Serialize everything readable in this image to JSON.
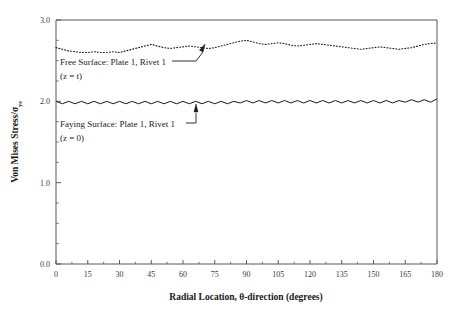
{
  "chart_data": {
    "type": "line",
    "title": "",
    "xlabel": "Radial Location, θ-direction (degrees)",
    "ylabel": "Von Mises Stress/σ",
    "ylabel_subscript": "ys",
    "xlim": [
      0,
      180
    ],
    "ylim": [
      0.0,
      3.0
    ],
    "grid": false,
    "legend_position": "inline-annotations",
    "xticks": [
      0,
      15,
      30,
      45,
      60,
      75,
      90,
      105,
      120,
      135,
      150,
      165,
      180
    ],
    "xticklabels": [
      "0",
      "15",
      "30",
      "45",
      "60",
      "75",
      "90",
      "105",
      "120",
      "135",
      "150",
      "165",
      "180"
    ],
    "yticks": [
      0.0,
      1.0,
      2.0,
      3.0
    ],
    "yticklabels": [
      "0.0",
      "1.0",
      "2.0",
      "3.0"
    ],
    "yticks_minor": [
      0.25,
      0.5,
      0.75,
      1.25,
      1.5,
      1.75,
      2.25,
      2.5,
      2.75
    ],
    "series": [
      {
        "name": "Free Surface: Plate 1, Rivet 1 (z = t)",
        "style": "dotted",
        "color": "#1a1a1a",
        "x": [
          0,
          3,
          6,
          9,
          12,
          15,
          18,
          21,
          24,
          27,
          30,
          33,
          36,
          39,
          42,
          45,
          48,
          51,
          54,
          57,
          60,
          63,
          66,
          69,
          72,
          75,
          78,
          81,
          84,
          87,
          90,
          93,
          96,
          99,
          102,
          105,
          108,
          111,
          114,
          117,
          120,
          123,
          126,
          129,
          132,
          135,
          138,
          141,
          144,
          147,
          150,
          153,
          156,
          159,
          162,
          165,
          168,
          171,
          174,
          177,
          180
        ],
        "y": [
          2.66,
          2.64,
          2.62,
          2.61,
          2.6,
          2.6,
          2.61,
          2.6,
          2.6,
          2.61,
          2.6,
          2.62,
          2.64,
          2.66,
          2.68,
          2.7,
          2.68,
          2.66,
          2.65,
          2.66,
          2.67,
          2.68,
          2.67,
          2.66,
          2.65,
          2.66,
          2.68,
          2.7,
          2.72,
          2.74,
          2.75,
          2.73,
          2.71,
          2.7,
          2.71,
          2.72,
          2.71,
          2.69,
          2.68,
          2.69,
          2.7,
          2.71,
          2.7,
          2.69,
          2.68,
          2.67,
          2.66,
          2.65,
          2.64,
          2.65,
          2.66,
          2.67,
          2.66,
          2.65,
          2.64,
          2.65,
          2.66,
          2.68,
          2.7,
          2.71,
          2.72
        ]
      },
      {
        "name": "Faying Surface: Plate 1, Rivet 1 (z = 0)",
        "style": "solid",
        "color": "#1a1a1a",
        "x": [
          0,
          3,
          6,
          9,
          12,
          15,
          18,
          21,
          24,
          27,
          30,
          33,
          36,
          39,
          42,
          45,
          48,
          51,
          54,
          57,
          60,
          63,
          66,
          69,
          72,
          75,
          78,
          81,
          84,
          87,
          90,
          93,
          96,
          99,
          102,
          105,
          108,
          111,
          114,
          117,
          120,
          123,
          126,
          129,
          132,
          135,
          138,
          141,
          144,
          147,
          150,
          153,
          156,
          159,
          162,
          165,
          168,
          171,
          174,
          177,
          180
        ],
        "y": [
          2.0,
          1.97,
          2.0,
          1.97,
          2.0,
          1.97,
          2.0,
          1.97,
          2.0,
          1.97,
          2.0,
          1.97,
          2.0,
          1.97,
          2.0,
          1.97,
          2.0,
          1.97,
          2.0,
          1.97,
          2.0,
          1.97,
          2.0,
          1.97,
          2.0,
          1.97,
          2.0,
          1.97,
          2.0,
          1.98,
          2.01,
          1.98,
          2.01,
          1.98,
          2.01,
          1.98,
          2.01,
          1.98,
          2.01,
          1.98,
          2.01,
          1.98,
          2.01,
          1.98,
          2.01,
          1.98,
          2.01,
          1.98,
          2.01,
          1.98,
          2.01,
          1.98,
          2.01,
          1.98,
          2.01,
          1.99,
          2.02,
          1.99,
          2.02,
          1.99,
          2.03
        ]
      }
    ],
    "annotations": [
      {
        "id": "free-surface",
        "line1": "Free Surface: Plate 1, Rivet 1",
        "line2": "(z = t)",
        "text_x": 60,
        "text_y": 65,
        "leader": "M 172 61 L 196 61 L 203 52",
        "arrow_tip_x": 205,
        "arrow_tip_y": 44
      },
      {
        "id": "faying-surface",
        "line1": "Faying Surface: Plate 1, Rivet 1",
        "line2": "(z = 0)",
        "text_x": 60,
        "text_y": 127,
        "leader": "M 186 123 L 196 123 L 196 113",
        "arrow_tip_x": 196,
        "arrow_tip_y": 104
      }
    ]
  },
  "plot_area": {
    "left": 56,
    "right": 437,
    "top": 20,
    "bottom": 264
  }
}
